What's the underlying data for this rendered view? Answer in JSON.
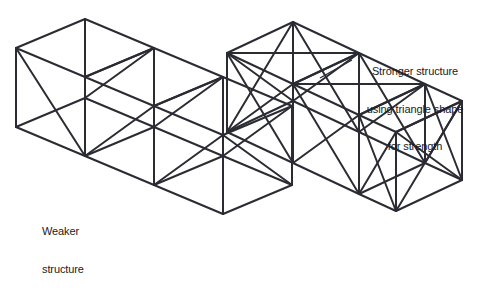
{
  "figure": {
    "background_color": "#ffffff",
    "stroke_color": "#2b2b33",
    "text_color": "#1a1a22",
    "width": 479,
    "height": 303
  },
  "labels": {
    "weaker": {
      "name": "weaker-structure-label",
      "lines": [
        "Weaker",
        "structure"
      ],
      "line1": "Weaker",
      "line2": "structure",
      "align": "left"
    },
    "stronger": {
      "name": "stronger-structure-label",
      "lines": [
        "Stronger structure",
        "using triangle shape",
        "for strength"
      ],
      "line1": "Stronger structure",
      "line2": "using triangle shape",
      "line3": "for strength",
      "align": "center"
    }
  },
  "structures": [
    {
      "id": "weaker",
      "name": "weaker-truss-structure",
      "cubes": 3,
      "bracing": "partial-single-diagonal",
      "description": "Three isometric cubes in a row with only a few single diagonal braces"
    },
    {
      "id": "stronger",
      "name": "stronger-truss-structure",
      "cubes": 3,
      "bracing": "full-cross-diagonal-triangles",
      "description": "Three isometric cubes in a row with X cross-braces forming triangles on the faces"
    }
  ]
}
